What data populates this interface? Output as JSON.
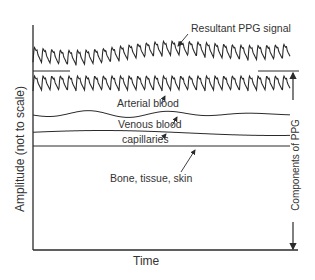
{
  "diagram": {
    "x_axis_label": "Time",
    "y_axis_label": "Amplitude (not to scale)",
    "side_label": "Components of PPG",
    "labels": {
      "resultant": "Resultant PPG signal",
      "arterial": "Arterial blood",
      "venous": "Venous blood",
      "capillaries": "capillaries",
      "bone": "Bone, tissue, skin"
    },
    "colors": {
      "line": "#2a2a2a",
      "background": "#ffffff"
    },
    "layers": [
      {
        "name": "Resultant PPG signal",
        "type": "pulsatile waveform (sum of components)"
      },
      {
        "name": "Arterial blood",
        "type": "pulsatile AC component"
      },
      {
        "name": "Venous blood",
        "type": "slow low-amplitude wave"
      },
      {
        "name": "capillaries",
        "type": "very slow gentle wave"
      },
      {
        "name": "Bone, tissue, skin",
        "type": "constant DC baseline"
      }
    ]
  }
}
